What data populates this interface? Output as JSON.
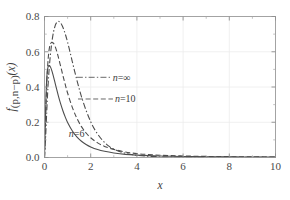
{
  "chart_data": {
    "type": "line",
    "title": "",
    "xlabel": "x",
    "ylabel": "f_(p,n-p)(x)",
    "ylabel_parts": {
      "f": "f",
      "sub": "(p,n−p)",
      "arg": "(x)"
    },
    "xlim": [
      0,
      10
    ],
    "ylim": [
      0,
      0.8
    ],
    "xticks": [
      0,
      2,
      4,
      6,
      8,
      10
    ],
    "xtick_labels": [
      "0",
      "2",
      "4",
      "6",
      "8",
      "10"
    ],
    "yticks": [
      0.0,
      0.2,
      0.4,
      0.6,
      0.8
    ],
    "ytick_labels": [
      "0.0",
      "0.2",
      "0.4",
      "0.6",
      "0.8"
    ],
    "x_minor_ticks": [
      1,
      3,
      5,
      7,
      9
    ],
    "y_minor_ticks": [
      0.1,
      0.3,
      0.5,
      0.7
    ],
    "grid": true,
    "grid_color": "#ececec",
    "frame_color": "#9a9a9a",
    "legend_position": "inline-annotations",
    "curve_color": "#4d4d4d",
    "series": [
      {
        "name": "n=∞",
        "label_n": "n",
        "label_eq": "=",
        "label_val": "∞",
        "style": "dashdot",
        "peak_x": 0.62,
        "peak_y": 0.772,
        "annotation_x": 2.95,
        "annotation_y": 0.455,
        "x": [
          0.0,
          0.05,
          0.1,
          0.15,
          0.2,
          0.25,
          0.3,
          0.35,
          0.4,
          0.45,
          0.5,
          0.55,
          0.6,
          0.62,
          0.65,
          0.7,
          0.75,
          0.8,
          0.85,
          0.9,
          0.95,
          1.0,
          1.1,
          1.2,
          1.3,
          1.4,
          1.5,
          1.6,
          1.8,
          2.0,
          2.2,
          2.5,
          2.8,
          3.0,
          3.5,
          4.0,
          4.5,
          5.0,
          5.5,
          6.0,
          6.5,
          7.0,
          7.5,
          8.0,
          9.0,
          10.0
        ],
        "y": [
          0.0,
          0.12,
          0.27,
          0.4,
          0.5,
          0.575,
          0.635,
          0.683,
          0.718,
          0.743,
          0.76,
          0.769,
          0.772,
          0.772,
          0.77,
          0.763,
          0.752,
          0.738,
          0.72,
          0.7,
          0.678,
          0.654,
          0.601,
          0.546,
          0.492,
          0.44,
          0.391,
          0.345,
          0.267,
          0.203,
          0.153,
          0.099,
          0.063,
          0.047,
          0.024,
          0.0125,
          0.007,
          0.0042,
          0.0028,
          0.002,
          0.0016,
          0.0013,
          0.0011,
          0.001,
          0.0009,
          0.0008
        ]
      },
      {
        "name": "n=10",
        "label_n": "n",
        "label_eq": "=",
        "label_val": "10",
        "style": "dashed",
        "peak_x": 0.36,
        "peak_y": 0.652,
        "annotation_x": 3.05,
        "annotation_y": 0.332,
        "x": [
          0.0,
          0.03,
          0.06,
          0.1,
          0.14,
          0.18,
          0.22,
          0.26,
          0.3,
          0.33,
          0.36,
          0.4,
          0.45,
          0.5,
          0.55,
          0.6,
          0.7,
          0.8,
          0.9,
          1.0,
          1.2,
          1.4,
          1.6,
          1.8,
          2.0,
          2.3,
          2.6,
          3.0,
          3.5,
          4.0,
          4.5,
          5.0,
          5.5,
          6.0,
          6.5,
          7.0,
          7.5,
          8.0,
          9.0,
          10.0
        ],
        "y": [
          0.0,
          0.13,
          0.27,
          0.42,
          0.525,
          0.59,
          0.628,
          0.646,
          0.652,
          0.652,
          0.651,
          0.646,
          0.633,
          0.615,
          0.593,
          0.569,
          0.517,
          0.464,
          0.413,
          0.366,
          0.286,
          0.223,
          0.175,
          0.139,
          0.112,
          0.083,
          0.063,
          0.046,
          0.031,
          0.022,
          0.017,
          0.013,
          0.0105,
          0.0087,
          0.0073,
          0.0062,
          0.0054,
          0.0047,
          0.0036,
          0.0029
        ]
      },
      {
        "name": "n=6",
        "label_n": "n",
        "label_eq": "=",
        "label_val": "6",
        "style": "solid",
        "peak_x": 0.21,
        "peak_y": 0.522,
        "annotation_x": 1.05,
        "annotation_y": 0.135,
        "x": [
          0.0,
          0.03,
          0.06,
          0.09,
          0.12,
          0.15,
          0.18,
          0.21,
          0.24,
          0.28,
          0.32,
          0.36,
          0.4,
          0.45,
          0.5,
          0.6,
          0.7,
          0.8,
          0.9,
          1.0,
          1.2,
          1.4,
          1.6,
          1.8,
          2.0,
          2.3,
          2.6,
          3.0,
          3.5,
          4.0,
          4.5,
          5.0,
          5.5,
          6.0,
          6.5,
          7.0,
          7.5,
          8.0,
          9.0,
          10.0
        ],
        "y": [
          0.0,
          0.175,
          0.33,
          0.432,
          0.487,
          0.512,
          0.521,
          0.522,
          0.518,
          0.507,
          0.491,
          0.473,
          0.453,
          0.427,
          0.401,
          0.35,
          0.304,
          0.264,
          0.229,
          0.199,
          0.152,
          0.117,
          0.092,
          0.074,
          0.06,
          0.045,
          0.035,
          0.026,
          0.018,
          0.0135,
          0.0105,
          0.0085,
          0.007,
          0.0059,
          0.005,
          0.0043,
          0.0038,
          0.0033,
          0.0026,
          0.0021
        ]
      }
    ]
  },
  "figure": {
    "xlabel": "x",
    "ylabel_f": "f",
    "ylabel_sub": "(p,n−p)",
    "ylabel_arg": "(x)"
  }
}
